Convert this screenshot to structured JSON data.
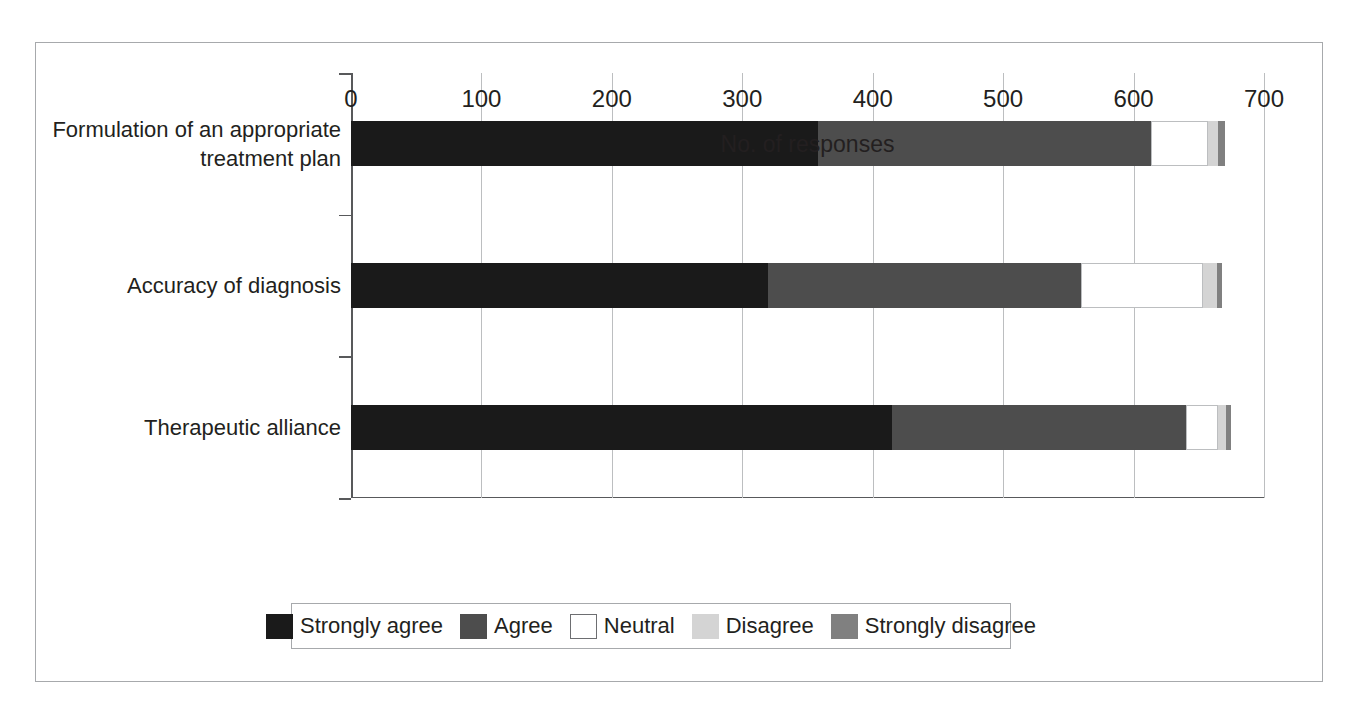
{
  "chart_data": {
    "type": "bar",
    "orientation": "horizontal",
    "stacked": true,
    "title": "",
    "xlabel": "No. of responses",
    "ylabel": "",
    "xlim": [
      0,
      700
    ],
    "xticks": [
      "0",
      "100",
      "200",
      "300",
      "400",
      "500",
      "600",
      "700"
    ],
    "grid": "vertical",
    "legend_position": "bottom",
    "categories": [
      "Formulation of an appropriate\ntreatment plan",
      "Accuracy of diagnosis",
      "Therapeutic alliance"
    ],
    "series": [
      {
        "name": "Strongly agree",
        "color": "#1a1a1a",
        "values": [
          358,
          320,
          415
        ]
      },
      {
        "name": "Agree",
        "color": "#4d4d4d",
        "values": [
          255,
          240,
          225
        ]
      },
      {
        "name": "Neutral",
        "color": "#ffffff",
        "values": [
          44,
          93,
          25
        ]
      },
      {
        "name": "Disagree",
        "color": "#d4d4d4",
        "values": [
          8,
          11,
          6
        ]
      },
      {
        "name": "Strongly disagree",
        "color": "#808080",
        "values": [
          5,
          4,
          4
        ]
      }
    ]
  },
  "legend": {
    "items": [
      {
        "label": "Strongly agree"
      },
      {
        "label": "Agree"
      },
      {
        "label": "Neutral"
      },
      {
        "label": "Disagree"
      },
      {
        "label": "Strongly disagree"
      }
    ]
  },
  "colors": {
    "strongly_agree": "#1a1a1a",
    "agree": "#4d4d4d",
    "neutral": "#ffffff",
    "disagree": "#d4d4d4",
    "strongly_disagree": "#808080",
    "axis": "#58595b",
    "grid": "#bcbec0",
    "frame": "#a7a9ac",
    "text": "#231f20"
  }
}
